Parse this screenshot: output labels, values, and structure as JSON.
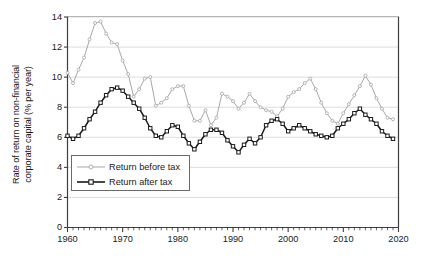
{
  "chart_data": {
    "type": "line",
    "title": "",
    "subtitle": "",
    "xlabel": "",
    "ylabel": "Rate of return on non-financial corporate capital (% per year)",
    "ylabel_line1": "Rate of return on non-financial",
    "ylabel_line2": "corporate capital (% per year)",
    "xlim": [
      1960,
      2020
    ],
    "ylim": [
      0,
      14
    ],
    "y_ticks": [
      0,
      2,
      4,
      6,
      8,
      10,
      12,
      14
    ],
    "y_tick_labels": [
      "0",
      "2",
      "4",
      "6",
      "8",
      "10",
      "12",
      "14"
    ],
    "x_ticks": [
      1960,
      1970,
      1980,
      1990,
      2000,
      2010,
      2020
    ],
    "x_tick_labels": [
      "1960",
      "1970",
      "1980",
      "1990",
      "2000",
      "2010",
      "2020"
    ],
    "x_minor_tick_step": 1,
    "grid": "horizontal-major-only",
    "grid_color": "#d9d9d9",
    "axis_color": "#3d3d3d",
    "legend_position": "lower-left-inside",
    "legend": [
      {
        "name": "Return before tax",
        "color": "#a8a8a8",
        "marker": "circle-open"
      },
      {
        "name": "Return after tax",
        "color": "#1a1a1a",
        "marker": "square-open"
      }
    ],
    "x": [
      1960,
      1961,
      1962,
      1963,
      1964,
      1965,
      1966,
      1967,
      1968,
      1969,
      1970,
      1971,
      1972,
      1973,
      1974,
      1975,
      1976,
      1977,
      1978,
      1979,
      1980,
      1981,
      1982,
      1983,
      1984,
      1985,
      1986,
      1987,
      1988,
      1989,
      1990,
      1991,
      1992,
      1993,
      1994,
      1995,
      1996,
      1997,
      1998,
      1999,
      2000,
      2001,
      2002,
      2003,
      2004,
      2005,
      2006,
      2007,
      2008,
      2009,
      2010,
      2011,
      2012,
      2013,
      2014,
      2015,
      2016,
      2017,
      2018,
      2019
    ],
    "series": [
      {
        "name": "Return before tax",
        "color": "#a8a8a8",
        "marker": "circle-open",
        "values": [
          10.3,
          9.6,
          10.5,
          11.3,
          12.5,
          13.6,
          13.7,
          12.9,
          12.3,
          12.2,
          11.1,
          10.2,
          8.7,
          9.2,
          9.9,
          10.0,
          8.1,
          8.3,
          8.6,
          9.2,
          9.4,
          9.4,
          8.1,
          7.1,
          7.1,
          7.8,
          6.8,
          7.3,
          8.9,
          8.7,
          8.4,
          7.9,
          8.3,
          8.9,
          8.4,
          8.0,
          7.8,
          7.7,
          7.4,
          7.9,
          8.7,
          9.0,
          9.2,
          9.6,
          9.9,
          9.2,
          8.3,
          7.6,
          7.1,
          6.9,
          7.6,
          8.2,
          8.8,
          9.4,
          10.1,
          9.5,
          8.6,
          7.9,
          7.3,
          7.2
        ]
      },
      {
        "name": "Return after tax",
        "color": "#1a1a1a",
        "marker": "square-open",
        "values": [
          6.1,
          5.9,
          6.1,
          6.6,
          7.2,
          7.7,
          8.3,
          8.8,
          9.2,
          9.3,
          9.1,
          8.7,
          8.3,
          7.9,
          7.3,
          6.6,
          6.1,
          6.0,
          6.4,
          6.8,
          6.7,
          6.1,
          5.6,
          5.2,
          5.7,
          6.2,
          6.5,
          6.5,
          6.3,
          5.8,
          5.4,
          5.0,
          5.5,
          5.9,
          5.6,
          6.0,
          6.8,
          7.1,
          7.2,
          6.9,
          6.4,
          6.6,
          6.8,
          6.6,
          6.4,
          6.2,
          6.1,
          6.0,
          6.1,
          6.6,
          6.9,
          7.2,
          7.6,
          7.9,
          7.5,
          7.2,
          6.9,
          6.4,
          6.1,
          5.9
        ]
      }
    ]
  },
  "axes": {
    "y_axis_title": "Rate of return on non-financial corporate capital (% per year)"
  }
}
